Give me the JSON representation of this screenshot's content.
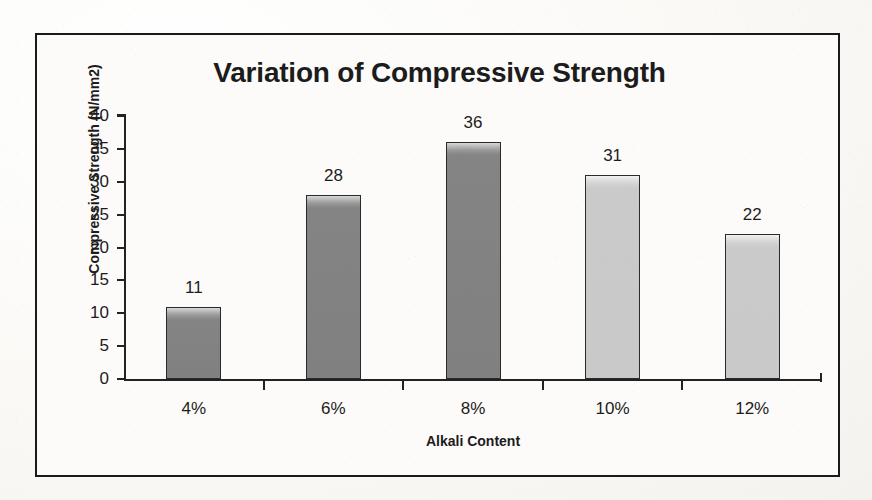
{
  "chart_data": {
    "type": "bar",
    "title": "Variation of Compressive Strength",
    "xlabel": "Alkali Content",
    "ylabel": "Compressive Strength (N/mm2)",
    "categories": [
      "4%",
      "6%",
      "8%",
      "10%",
      "12%"
    ],
    "values": [
      11,
      28,
      36,
      31,
      22
    ],
    "value_labels": [
      "11",
      "28",
      "36",
      "31",
      "22"
    ],
    "ylim": [
      0,
      40
    ],
    "ytick_labels": [
      "0",
      "5",
      "10",
      "15",
      "20",
      "25",
      "30",
      "35",
      "40"
    ],
    "ytick_values": [
      0,
      5,
      10,
      15,
      20,
      25,
      30,
      35,
      40
    ],
    "grid": false,
    "legend": false,
    "legend_position": "none",
    "bar_colors": [
      "#808080",
      "#808080",
      "#808080",
      "#c9c9c9",
      "#c9c9c9"
    ],
    "bar_outline_color": "#2a2a2a",
    "series": [
      {
        "name": "Compressive Strength",
        "values": [
          11,
          28,
          36,
          31,
          22
        ]
      }
    ]
  },
  "figure": {
    "background_color": "#fcfbf9",
    "border_color": "#1a1a1a",
    "text_color": "#1c1c1c"
  }
}
